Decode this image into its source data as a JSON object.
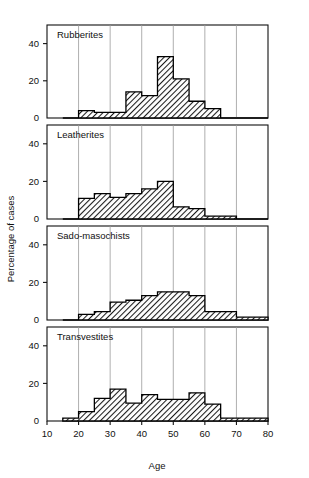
{
  "figure": {
    "width": 309,
    "height": 478,
    "background": "#ffffff",
    "ink": "#111111",
    "bar_fill": "hatch-diagonal",
    "bar_edge": "#000000"
  },
  "axes": {
    "xlabel": "Age",
    "ylabel": "Percentage of cases",
    "xlim": [
      10,
      80
    ],
    "xticks": [
      10,
      20,
      30,
      40,
      50,
      60,
      70,
      80
    ],
    "xticklabels": [
      "10",
      "20",
      "30",
      "40",
      "50",
      "60",
      "70",
      "80"
    ],
    "ylim": [
      0,
      50
    ],
    "yticks": [
      0,
      20,
      40
    ],
    "yticklabels": [
      "0",
      "20",
      "40"
    ],
    "gridlines_x": [
      20,
      30,
      40,
      50,
      60,
      70
    ],
    "grid": "vertical-only",
    "bin_width": 5
  },
  "chart_data": {
    "type": "bar",
    "title": "",
    "xlabel": "Age",
    "ylabel": "Percentage of cases",
    "xlim": [
      10,
      80
    ],
    "ylim": [
      0,
      50
    ],
    "grid": "vertical gridlines at 20,30,40,50,60,70",
    "legend": "none (panel titles in-plot)",
    "bin_edges": [
      15,
      20,
      25,
      30,
      35,
      40,
      45,
      50,
      55,
      60,
      65,
      70,
      75,
      80
    ],
    "bin_centers": [
      17.5,
      22.5,
      27.5,
      32.5,
      37.5,
      42.5,
      47.5,
      52.5,
      57.5,
      62.5,
      67.5,
      72.5,
      77.5
    ],
    "panels": [
      {
        "name": "Rubberites",
        "values": [
          0,
          4,
          3,
          3,
          14,
          12,
          33,
          21,
          9,
          5,
          0,
          0,
          0
        ]
      },
      {
        "name": "Leatherites",
        "values": [
          0,
          11,
          13.5,
          11.5,
          13.5,
          16,
          20,
          6.5,
          5.5,
          1.5,
          1.5,
          0,
          0
        ]
      },
      {
        "name": "Sado-masochists",
        "values": [
          0,
          3,
          4.5,
          9.5,
          10.5,
          13,
          15,
          15,
          13,
          4.5,
          4.5,
          1.5,
          1.5
        ]
      },
      {
        "name": "Transvestites",
        "values": [
          1.5,
          5,
          12,
          17,
          9.5,
          14,
          11.5,
          11.5,
          15,
          9,
          1.5,
          1.5,
          1.5
        ]
      }
    ]
  },
  "panel_titles": {
    "p0": "Rubberites",
    "p1": "Leatherites",
    "p2": "Sado-masochists",
    "p3": "Transvestites"
  }
}
